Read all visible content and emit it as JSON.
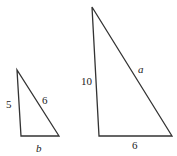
{
  "small_triangle": {
    "left_side": "5",
    "hypotenuse": "6",
    "base": "b"
  },
  "large_triangle": {
    "left_side": "10",
    "hypotenuse": "a",
    "base": "6"
  },
  "colors": {
    "stroke": "#333333",
    "text": "#222222"
  }
}
